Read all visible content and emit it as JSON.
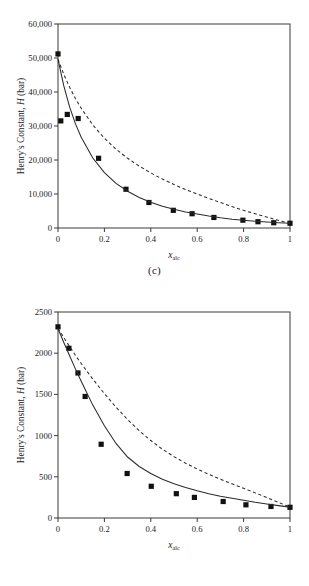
{
  "figure": {
    "panels": [
      {
        "id": "c",
        "caption": "(c)",
        "chart_index": 0
      },
      {
        "id": "d",
        "caption": "(d)",
        "chart_index": 1
      }
    ]
  },
  "chart_data": [
    {
      "type": "scatter",
      "title": "",
      "panel_label": "(c)",
      "xlabel": "x_alc",
      "xlabel_base": "x",
      "xlabel_subscript": "alc",
      "ylabel": "Henry's Constant, H (bar)",
      "ylabel_parts": {
        "prefix": "Henry's Constant, ",
        "symbol": "H",
        "suffix": " (bar)"
      },
      "xlim": [
        0,
        1
      ],
      "ylim": [
        0,
        60000
      ],
      "xticks": [
        0,
        0.2,
        0.4,
        0.6,
        0.8,
        1
      ],
      "xtick_labels": [
        "0",
        "0.2",
        "0.4",
        "0.6",
        "0.8",
        "1"
      ],
      "yticks": [
        0,
        10000,
        20000,
        30000,
        40000,
        50000,
        60000
      ],
      "ytick_labels": [
        "0",
        "10,000",
        "20,000",
        "30,000",
        "40,000",
        "50,000",
        "60,000"
      ],
      "grid": false,
      "legend": "none",
      "series": [
        {
          "name": "experimental data",
          "kind": "markers",
          "marker": "filled-square",
          "points": [
            [
              0.0,
              51200
            ],
            [
              0.012,
              31500
            ],
            [
              0.04,
              33400
            ],
            [
              0.087,
              32200
            ],
            [
              0.175,
              20500
            ],
            [
              0.293,
              11400
            ],
            [
              0.392,
              7500
            ],
            [
              0.497,
              5200
            ],
            [
              0.578,
              4200
            ],
            [
              0.672,
              3100
            ],
            [
              0.797,
              2300
            ],
            [
              0.862,
              1850
            ],
            [
              0.93,
              1550
            ],
            [
              1.0,
              1400
            ]
          ]
        },
        {
          "name": "model-solid",
          "kind": "line",
          "style": "solid",
          "points": [
            [
              0.0,
              49600
            ],
            [
              0.025,
              41800
            ],
            [
              0.05,
              35600
            ],
            [
              0.075,
              30700
            ],
            [
              0.1,
              26700
            ],
            [
              0.15,
              20600
            ],
            [
              0.2,
              16300
            ],
            [
              0.25,
              13100
            ],
            [
              0.3,
              10800
            ],
            [
              0.35,
              9000
            ],
            [
              0.4,
              7600
            ],
            [
              0.45,
              6400
            ],
            [
              0.5,
              5500
            ],
            [
              0.55,
              4700
            ],
            [
              0.6,
              4100
            ],
            [
              0.65,
              3500
            ],
            [
              0.7,
              3000
            ],
            [
              0.75,
              2600
            ],
            [
              0.8,
              2300
            ],
            [
              0.85,
              2000
            ],
            [
              0.9,
              1750
            ],
            [
              0.95,
              1550
            ],
            [
              1.0,
              1400
            ]
          ]
        },
        {
          "name": "model-dashed",
          "kind": "line",
          "style": "dashed",
          "points": [
            [
              0.0,
              49600
            ],
            [
              0.025,
              45200
            ],
            [
              0.05,
              41400
            ],
            [
              0.075,
              38100
            ],
            [
              0.1,
              35200
            ],
            [
              0.15,
              30300
            ],
            [
              0.2,
              26400
            ],
            [
              0.25,
              23200
            ],
            [
              0.3,
              20500
            ],
            [
              0.35,
              18200
            ],
            [
              0.4,
              16200
            ],
            [
              0.45,
              14400
            ],
            [
              0.5,
              12800
            ],
            [
              0.55,
              11300
            ],
            [
              0.6,
              10000
            ],
            [
              0.65,
              8700
            ],
            [
              0.7,
              7500
            ],
            [
              0.75,
              6300
            ],
            [
              0.8,
              5200
            ],
            [
              0.85,
              4200
            ],
            [
              0.9,
              3200
            ],
            [
              0.95,
              2250
            ],
            [
              1.0,
              1400
            ]
          ]
        }
      ]
    },
    {
      "type": "scatter",
      "title": "",
      "panel_label": "(d)",
      "xlabel": "x_alc",
      "xlabel_base": "x",
      "xlabel_subscript": "alc",
      "ylabel": "Henry's Constant, H (bar)",
      "ylabel_parts": {
        "prefix": "Henry's Constant, ",
        "symbol": "H",
        "suffix": " (bar)"
      },
      "xlim": [
        0,
        1
      ],
      "ylim": [
        0,
        2500
      ],
      "xticks": [
        0,
        0.2,
        0.4,
        0.6,
        0.8,
        1
      ],
      "xtick_labels": [
        "0",
        "0.2",
        "0.4",
        "0.6",
        "0.8",
        "1"
      ],
      "yticks": [
        0,
        500,
        1000,
        1500,
        2000,
        2500
      ],
      "ytick_labels": [
        "0",
        "500",
        "1000",
        "1500",
        "2000",
        "2500"
      ],
      "grid": false,
      "legend": "none",
      "series": [
        {
          "name": "experimental data",
          "kind": "markers",
          "marker": "filled-square",
          "points": [
            [
              0.0,
              2320
            ],
            [
              0.047,
              2060
            ],
            [
              0.086,
              1760
            ],
            [
              0.117,
              1475
            ],
            [
              0.186,
              895
            ],
            [
              0.298,
              540
            ],
            [
              0.402,
              385
            ],
            [
              0.51,
              295
            ],
            [
              0.588,
              250
            ],
            [
              0.712,
              200
            ],
            [
              0.81,
              160
            ],
            [
              0.918,
              140
            ],
            [
              1.0,
              130
            ]
          ]
        },
        {
          "name": "model-solid",
          "kind": "line",
          "style": "solid",
          "points": [
            [
              0.0,
              2300
            ],
            [
              0.025,
              2130
            ],
            [
              0.05,
              1970
            ],
            [
              0.075,
              1810
            ],
            [
              0.1,
              1660
            ],
            [
              0.15,
              1370
            ],
            [
              0.2,
              1120
            ],
            [
              0.25,
              905
            ],
            [
              0.3,
              740
            ],
            [
              0.35,
              625
            ],
            [
              0.4,
              540
            ],
            [
              0.45,
              470
            ],
            [
              0.5,
              415
            ],
            [
              0.55,
              370
            ],
            [
              0.6,
              330
            ],
            [
              0.65,
              295
            ],
            [
              0.7,
              265
            ],
            [
              0.75,
              240
            ],
            [
              0.8,
              215
            ],
            [
              0.85,
              190
            ],
            [
              0.9,
              170
            ],
            [
              0.95,
              150
            ],
            [
              1.0,
              132
            ]
          ]
        },
        {
          "name": "model-dashed",
          "kind": "line",
          "style": "dashed",
          "points": [
            [
              0.0,
              2300
            ],
            [
              0.025,
              2190
            ],
            [
              0.05,
              2080
            ],
            [
              0.075,
              1975
            ],
            [
              0.1,
              1875
            ],
            [
              0.15,
              1685
            ],
            [
              0.2,
              1510
            ],
            [
              0.25,
              1345
            ],
            [
              0.3,
              1195
            ],
            [
              0.35,
              1060
            ],
            [
              0.4,
              940
            ],
            [
              0.45,
              835
            ],
            [
              0.5,
              745
            ],
            [
              0.55,
              665
            ],
            [
              0.6,
              595
            ],
            [
              0.65,
              530
            ],
            [
              0.7,
              470
            ],
            [
              0.75,
              415
            ],
            [
              0.8,
              360
            ],
            [
              0.85,
              305
            ],
            [
              0.9,
              248
            ],
            [
              0.95,
              190
            ],
            [
              1.0,
              132
            ]
          ]
        }
      ]
    }
  ]
}
